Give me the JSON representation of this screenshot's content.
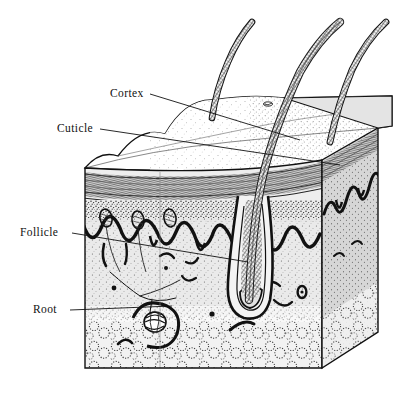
{
  "figure": {
    "type": "anatomical-illustration",
    "style": "black-and-white line engraving with stipple shading",
    "background_color": "#ffffff",
    "ink_color": "#111111"
  },
  "labels": [
    {
      "id": "cortex",
      "text": "Cortex",
      "x": 110,
      "y": 97,
      "anchor": "start"
    },
    {
      "id": "cuticle",
      "text": "Cuticle",
      "x": 57,
      "y": 132,
      "anchor": "start"
    },
    {
      "id": "follicle",
      "text": "Follicle",
      "x": 20,
      "y": 236,
      "anchor": "start"
    },
    {
      "id": "root",
      "text": "Root",
      "x": 33,
      "y": 313,
      "anchor": "start"
    }
  ],
  "leaders": [
    {
      "id": "cortex-leader",
      "points": "150,94 300,140"
    },
    {
      "id": "cuticle-leader",
      "points": "100,129 340,165"
    },
    {
      "id": "follicle-leader",
      "points": "72,233 248,262"
    },
    {
      "id": "root-leader",
      "points": "70,310 172,306"
    }
  ],
  "structures": {
    "hairs": [
      {
        "id": "hair-left",
        "note": "hair shaft emerging at left of top face"
      },
      {
        "id": "hair-center",
        "note": "long hair shaft tracing down to follicle bulb"
      },
      {
        "id": "hair-right",
        "note": "hair shaft at right of top face"
      }
    ],
    "layers": [
      {
        "id": "epidermis",
        "note": "banded surface layer below skin top"
      },
      {
        "id": "dermis",
        "note": "stippled layer with rete ridges"
      },
      {
        "id": "subcutaneous-fat",
        "note": "bubbly fat cells at block base"
      }
    ],
    "glands": [
      {
        "id": "sweat-gland-coil",
        "note": "coiled ball at end of Root leader"
      },
      {
        "id": "sebaceous-glands",
        "note": "small oval glands along rete ridge"
      }
    ],
    "surface_marks": [
      {
        "id": "skin-pore",
        "note": "small pore on top face"
      }
    ]
  },
  "colors": {
    "ink": "#111111",
    "top_face": "#ffffff",
    "front_face": "#e9e9e9",
    "side_face": "#d3d3d3",
    "epidermis_band": "#b9b9b9",
    "stipple": "#3a3a3a"
  }
}
